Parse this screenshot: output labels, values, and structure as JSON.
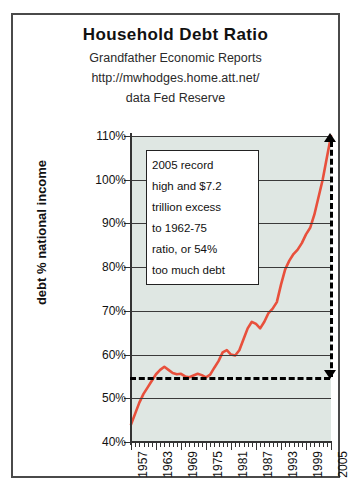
{
  "header": {
    "title": "Household Debt Ratio",
    "subtitle1": "Grandfather Economic Reports",
    "subtitle2": "http://mwhodges.home.att.net/",
    "subtitle3": "data Fed Reserve"
  },
  "annotation": {
    "lines": [
      "2005 record",
      "high and $7.2",
      "trillion excess",
      "to 1962-75",
      "ratio, or 54%",
      "too much debt"
    ]
  },
  "colors": {
    "series": "#e8503c",
    "plot_background": "#dfe7e3",
    "gridline": "#3a3a3a",
    "reference_line": "#000000",
    "frame": "#4a4a4a"
  },
  "chart_data": {
    "type": "line",
    "title": "Household Debt Ratio",
    "subtitle": "Grandfather Economic Reports",
    "source": "data Fed Reserve",
    "xlabel": "",
    "ylabel": "debt % national income",
    "xlim": [
      1957,
      2005
    ],
    "ylim": [
      40,
      110
    ],
    "grid": true,
    "legend": "none",
    "ytick_labels": [
      "110%",
      "100%",
      "90%",
      "80%",
      "70%",
      "60%",
      "50%",
      "40%"
    ],
    "ytick_values": [
      110,
      100,
      90,
      80,
      70,
      60,
      50,
      40
    ],
    "xtick_labels": [
      "1957",
      "1963",
      "1969",
      "1975",
      "1981",
      "1987",
      "1993",
      "1999",
      "2005"
    ],
    "xtick_values": [
      1957,
      1963,
      1969,
      1975,
      1981,
      1987,
      1993,
      1999,
      2005
    ],
    "reference_line": {
      "value": 54,
      "label": "1962-75 ratio, or 54%",
      "style": "dashed"
    },
    "excess_arrow": {
      "from": 54,
      "to": 110,
      "label": "$7.2 trillion excess",
      "style": "dashed-double-arrow"
    },
    "series": [
      {
        "name": "Household debt as % of national income",
        "x": [
          1957,
          1958,
          1959,
          1960,
          1961,
          1962,
          1963,
          1964,
          1965,
          1966,
          1967,
          1968,
          1969,
          1970,
          1971,
          1972,
          1973,
          1974,
          1975,
          1976,
          1977,
          1978,
          1979,
          1980,
          1981,
          1982,
          1983,
          1984,
          1985,
          1986,
          1987,
          1988,
          1989,
          1990,
          1991,
          1992,
          1993,
          1994,
          1995,
          1996,
          1997,
          1998,
          1999,
          2000,
          2001,
          2002,
          2003,
          2004,
          2005
        ],
        "values": [
          44.0,
          46.5,
          49.0,
          51.0,
          52.5,
          54.0,
          55.5,
          56.5,
          57.2,
          56.5,
          55.8,
          55.5,
          55.6,
          55.0,
          54.8,
          55.2,
          55.6,
          55.3,
          54.8,
          55.4,
          57.0,
          58.5,
          60.5,
          61.0,
          60.0,
          59.8,
          61.0,
          63.5,
          66.0,
          67.5,
          67.0,
          66.0,
          67.5,
          69.5,
          70.5,
          72.0,
          76.0,
          79.5,
          81.5,
          83.0,
          84.0,
          85.5,
          87.5,
          89.0,
          92.0,
          96.0,
          100.0,
          105.0,
          110.0
        ]
      }
    ]
  }
}
